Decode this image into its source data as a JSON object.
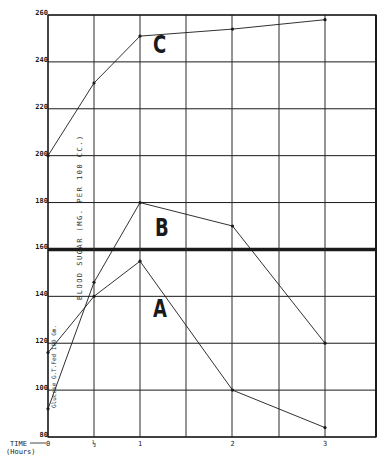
{
  "chart_data": {
    "type": "line",
    "title": "",
    "xlabel": "TIME (Hours)",
    "ylabel": "BLOOD SUGAR (MG. PER 100 CC.)",
    "annotation": "Glucose G.T.Fed 100 Gm.",
    "x": [
      0,
      0.5,
      1,
      2,
      3
    ],
    "x_tick_labels": [
      "0",
      "½",
      "1",
      "2",
      "3"
    ],
    "y_ticks": [
      80,
      100,
      120,
      140,
      160,
      180,
      200,
      220,
      240,
      260
    ],
    "ylim": [
      80,
      260
    ],
    "xlim": [
      0,
      3.55
    ],
    "grid": true,
    "reference_line": {
      "y": 160,
      "style": "heavy"
    },
    "series": [
      {
        "name": "A",
        "values": [
          116,
          140,
          155,
          100,
          84
        ]
      },
      {
        "name": "B",
        "values": [
          92,
          146,
          180,
          170,
          120
        ]
      },
      {
        "name": "C",
        "values": [
          200,
          231,
          251,
          254,
          258
        ]
      }
    ],
    "legend": "inline labels A, B, C"
  },
  "labels": {
    "xlabel_line1": "TIME",
    "xlabel_line2": "(Hours)",
    "ylabel": "BLOOD SUGAR  (MG. PER 100 CC.)",
    "glucose": "Glucose G.T.Fed 100 Gm.",
    "curve_a": "A",
    "curve_b": "B",
    "curve_c": "C"
  },
  "colors": {
    "ink": "#1a1a1a",
    "grid": "#333333",
    "background": "#ffffff"
  }
}
